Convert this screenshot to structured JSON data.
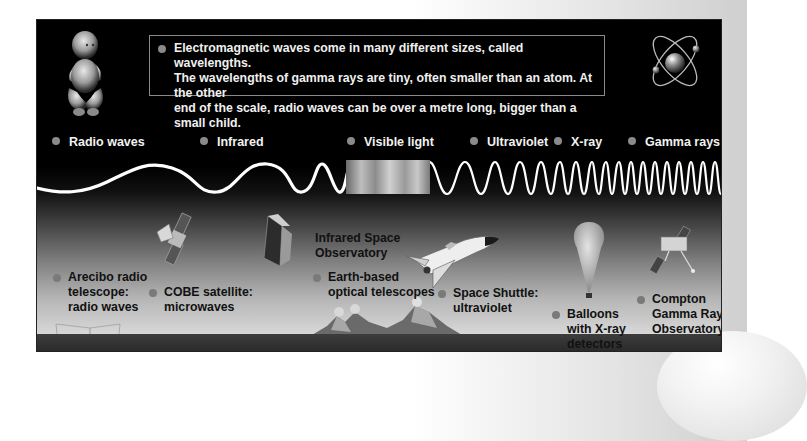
{
  "intro": {
    "line1": "Electromagnetic waves come in many different sizes, called wavelengths.",
    "line2": "The wavelengths of gamma rays are tiny, often smaller than an atom. At the other",
    "line3": "end of the scale, radio waves can be over a metre long, bigger than a small child."
  },
  "spectrum": {
    "bands": [
      {
        "label": "Radio waves"
      },
      {
        "label": "Infrared"
      },
      {
        "label": "Visible light"
      },
      {
        "label": "Ultraviolet"
      },
      {
        "label": "X-ray"
      },
      {
        "label": "Gamma rays"
      }
    ]
  },
  "instruments": [
    {
      "line1": "Arecibo radio",
      "line2": "telescope:",
      "line3": "radio waves"
    },
    {
      "line1": "COBE satellite:",
      "line2": "microwaves"
    },
    {
      "line1": "Infrared Space",
      "line2": "Observatory"
    },
    {
      "line1": "Earth-based",
      "line2": "optical telescopes"
    },
    {
      "line1": "Space Shuttle:",
      "line2": "ultraviolet"
    },
    {
      "line1": "Balloons",
      "line2": "with X-ray",
      "line3": "detectors"
    },
    {
      "line1": "Compton",
      "line2": "Gamma Ray",
      "line3": "Observatory"
    }
  ],
  "illustrations": {
    "baby": "baby-illustration",
    "atom": "atom-illustration"
  },
  "colors": {
    "panel_top": "#000000",
    "panel_bottom": "#d8d8d8",
    "ground": "#333333",
    "bullet": "#8a8a8a",
    "wave": "#ffffff"
  }
}
